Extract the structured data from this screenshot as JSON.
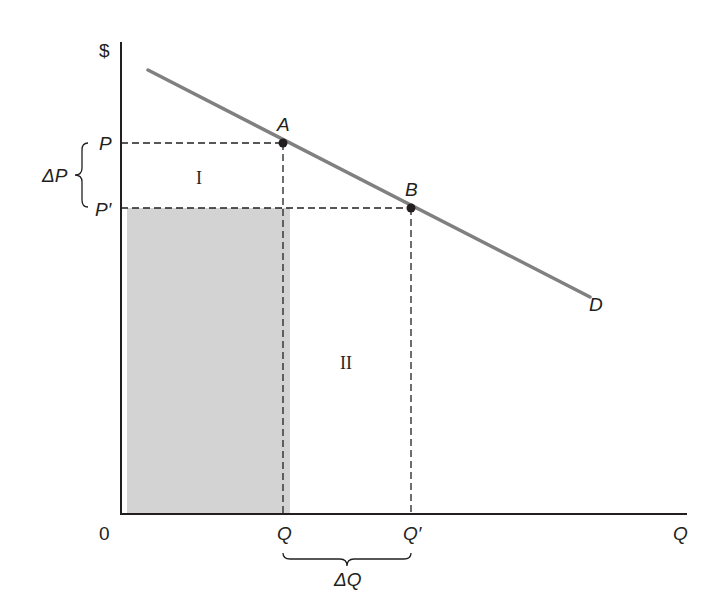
{
  "diagram": {
    "type": "demand-curve-elasticity",
    "axes": {
      "y_label": "$",
      "x_label": "Q",
      "origin_label": "0"
    },
    "price_labels": {
      "p": "P",
      "p_prime": "P′",
      "delta_p": "ΔP"
    },
    "quantity_labels": {
      "q": "Q",
      "q_prime": "Q′",
      "delta_q": "ΔQ"
    },
    "points": {
      "a": "A",
      "b": "B"
    },
    "curve_label": "D",
    "regions": {
      "region_1": "I",
      "region_2": "II"
    },
    "colors": {
      "axis": "#231f20",
      "demand_line": "#808080",
      "shaded_area": "#d3d3d3",
      "dashed_guides": "#231f20"
    }
  }
}
